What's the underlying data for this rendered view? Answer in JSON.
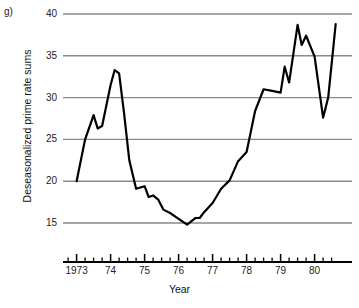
{
  "panel": {
    "label": "g)"
  },
  "chart_data": {
    "type": "line",
    "title": "",
    "xlabel": "Year",
    "ylabel": "Deseasonalized prime rate sums",
    "xlim": [
      1972.6,
      1981.1
    ],
    "ylim": [
      13.2,
      40.6
    ],
    "yticks": [
      15,
      20,
      25,
      30,
      35,
      40
    ],
    "ytick_labels": [
      "15",
      "20",
      "25",
      "30",
      "35",
      "40"
    ],
    "xticks": [
      1973,
      1974,
      1975,
      1976,
      1977,
      1978,
      1979,
      1980
    ],
    "xtick_labels": [
      "1973",
      "74",
      "75",
      "76",
      "77",
      "78",
      "79",
      "80"
    ],
    "minor_xticks_per_major": 4,
    "grid": "horizontal",
    "grid_color": "#8a8a8a",
    "line_color": "#000000",
    "line_width": 2.2,
    "legend": "none",
    "series": [
      {
        "name": "Deseasonalized prime rate sums",
        "x": [
          1973.0,
          1973.25,
          1973.5,
          1973.62,
          1973.75,
          1974.0,
          1974.12,
          1974.25,
          1974.4,
          1974.55,
          1974.75,
          1975.0,
          1975.12,
          1975.25,
          1975.4,
          1975.55,
          1975.75,
          1976.0,
          1976.25,
          1976.5,
          1976.62,
          1976.75,
          1977.0,
          1977.25,
          1977.5,
          1977.75,
          1978.0,
          1978.25,
          1978.5,
          1978.75,
          1979.0,
          1979.12,
          1979.25,
          1979.5,
          1979.62,
          1979.75,
          1980.0,
          1980.25,
          1980.4,
          1980.62
        ],
        "y": [
          20.0,
          25.0,
          27.9,
          26.3,
          26.6,
          31.5,
          33.3,
          32.9,
          28.0,
          22.5,
          19.1,
          19.4,
          18.1,
          18.3,
          17.8,
          16.6,
          16.2,
          15.5,
          14.8,
          15.6,
          15.6,
          16.3,
          17.4,
          19.1,
          20.1,
          22.4,
          23.5,
          28.4,
          31.0,
          30.8,
          30.6,
          33.7,
          31.8,
          38.7,
          36.3,
          37.4,
          34.9,
          27.6,
          30.0,
          38.8
        ]
      }
    ]
  }
}
